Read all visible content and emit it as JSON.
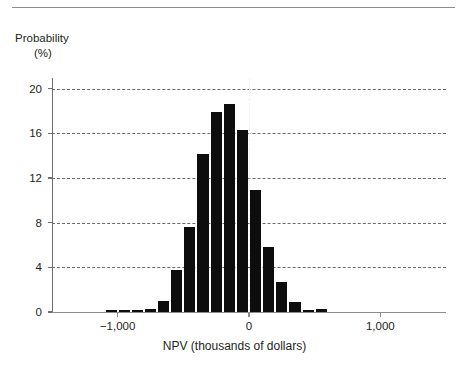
{
  "figure": {
    "top_rule": "horizontal-rule"
  },
  "axes": {
    "ylabel_line1": "Probability",
    "ylabel_line2": "(%)",
    "xlabel": "NPV (thousands of dollars)",
    "ytick_labels": [
      "0",
      "4",
      "8",
      "12",
      "16",
      "20"
    ],
    "xtick_labels": [
      "−1,000",
      "0",
      "1,000"
    ]
  },
  "colors": {
    "bar": "#0d0d0d",
    "grid": "#6b6a6a",
    "axis": "#8d8c8c",
    "text": "#231f20",
    "zero_line": "#f2f2f2",
    "background": "#ffffff"
  },
  "chart_data": {
    "type": "bar",
    "title": "",
    "subtitle": "",
    "xlabel": "NPV (thousands of dollars)",
    "ylabel": "Probability (%)",
    "xlim": [
      -1500,
      1500
    ],
    "ylim": [
      0,
      21.5
    ],
    "yticks": [
      0,
      4,
      8,
      12,
      16,
      20
    ],
    "xticks": [
      -1000,
      0,
      1000
    ],
    "grid": "horizontal-dashed",
    "legend": "none",
    "bin_width": 100,
    "annotations": [
      {
        "type": "vertical-dashed-line",
        "x": 0,
        "color": "#f2f2f2"
      }
    ],
    "categories": [
      "-1150",
      "-1050",
      "-950",
      "-850",
      "-750",
      "-650",
      "-550",
      "-450",
      "-350",
      "-250",
      "-150",
      "-50",
      "50",
      "150",
      "250",
      "350",
      "450",
      "550",
      "650",
      "750",
      "850",
      "950",
      "1050"
    ],
    "x": [
      -1150,
      -1050,
      -950,
      -850,
      -750,
      -650,
      -550,
      -450,
      -350,
      -250,
      -150,
      -50,
      50,
      150,
      250,
      350,
      450,
      550,
      650,
      750,
      850,
      950,
      1050
    ],
    "values": [
      0.0,
      0.2,
      0.15,
      0.15,
      0.3,
      0.95,
      3.8,
      7.6,
      14.2,
      17.9,
      18.6,
      16.3,
      10.9,
      5.8,
      2.65,
      0.9,
      0.2,
      0.25,
      0.0,
      0.0,
      0.0,
      0.0,
      0.0
    ]
  }
}
